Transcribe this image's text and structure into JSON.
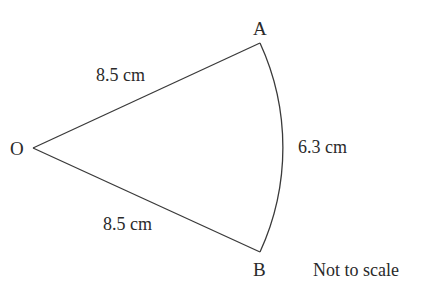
{
  "figure": {
    "type": "sector",
    "points": {
      "O": {
        "label": "O",
        "x": 33,
        "y": 148
      },
      "A": {
        "label": "A",
        "x": 260,
        "y": 43
      },
      "B": {
        "label": "B",
        "x": 260,
        "y": 252
      }
    },
    "edges": {
      "OA": {
        "label": "8.5 cm"
      },
      "OB": {
        "label": "8.5 cm"
      },
      "arcAB": {
        "label": "6.3 cm"
      }
    },
    "note": "Not to scale",
    "stroke_color": "#3a3a3a",
    "text_color": "#2a2a2a"
  }
}
